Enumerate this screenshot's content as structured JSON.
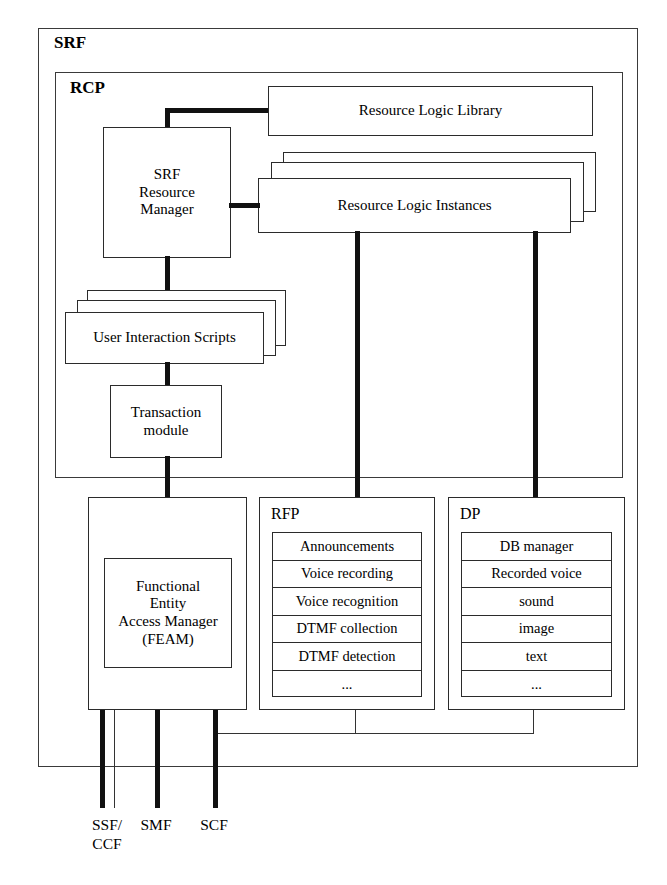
{
  "diagram": {
    "title": "SRF",
    "outer_container": {
      "label": "SRF"
    },
    "inner_container": {
      "label": "RCP"
    },
    "nodes": {
      "srf_resource_manager": {
        "label": "SRF\nResource\nManager"
      },
      "resource_logic_library": {
        "label": "Resource Logic Library"
      },
      "resource_logic_instances": {
        "label": "Resource Logic Instances"
      },
      "user_interaction_scripts": {
        "label": "User Interaction Scripts"
      },
      "transaction_module": {
        "label": "Transaction\nmodule"
      },
      "feam": {
        "label": "Functional\nEntity\nAccess Manager\n(FEAM)"
      }
    },
    "rfp": {
      "label": "RFP",
      "items": [
        "Announcements",
        "Voice recording",
        "Voice recognition",
        "DTMF collection",
        "DTMF detection",
        "..."
      ]
    },
    "dp": {
      "label": "DP",
      "items": [
        "DB manager",
        "Recorded voice",
        "sound",
        "image",
        "text",
        "..."
      ]
    },
    "interfaces": [
      {
        "id": "ssf-ccf",
        "label": "SSF/\nCCF"
      },
      {
        "id": "smf",
        "label": "SMF"
      },
      {
        "id": "scf",
        "label": "SCF"
      }
    ],
    "colors": {
      "line": "#2b2b2b",
      "thick_line": "#111111",
      "background": "#ffffff",
      "text": "#000000"
    }
  }
}
